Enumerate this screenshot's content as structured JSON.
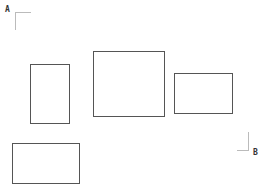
{
  "corners": {
    "a": {
      "label": "A"
    },
    "b": {
      "label": "B"
    }
  },
  "colors": {
    "rect_border": "#555555",
    "bracket": "#bbbbbb",
    "background": "#ffffff"
  },
  "rectangles": [
    {
      "id": "rect-1",
      "x": 30,
      "y": 64,
      "w": 40,
      "h": 60
    },
    {
      "id": "rect-2",
      "x": 93,
      "y": 51,
      "w": 72,
      "h": 66
    },
    {
      "id": "rect-3",
      "x": 174,
      "y": 73,
      "w": 59,
      "h": 41
    },
    {
      "id": "rect-4",
      "x": 12,
      "y": 143,
      "w": 68,
      "h": 41
    }
  ]
}
